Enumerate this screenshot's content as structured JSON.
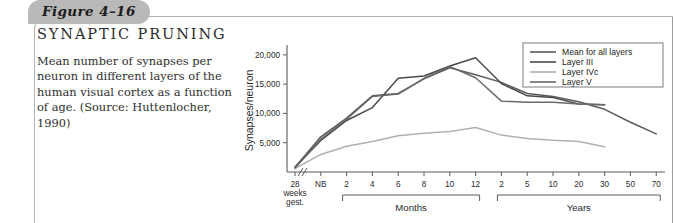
{
  "figure": {
    "tab_label": "Figure 4–16",
    "title": "SYNAPTIC PRUNING",
    "caption": "Mean number of synapses per neuron in different layers of the human visual cortex as a function of age. (Source: Huttenlocher, 1990)"
  },
  "chart_data": {
    "type": "line",
    "title": "",
    "xlabel": "",
    "ylabel": "Synapses/neuron",
    "ylim": [
      0,
      21000
    ],
    "yticks": [
      5000,
      10000,
      15000,
      20000
    ],
    "ytick_labels": [
      "5,000",
      "10,000",
      "15,000",
      "20,000"
    ],
    "grid": false,
    "legend_position": "top-right",
    "axis_break": "//",
    "x_categories": [
      "28 weeks gest.",
      "NB",
      "2",
      "4",
      "6",
      "8",
      "10",
      "12",
      "2",
      "5",
      "10",
      "20",
      "30",
      "50",
      "70"
    ],
    "x_tick_labels": [
      "28",
      "NB",
      "2",
      "4",
      "6",
      "8",
      "10",
      "12",
      "2",
      "5",
      "10",
      "20",
      "30",
      "50",
      "70"
    ],
    "x_first_label_lines": [
      "28",
      "weeks",
      "gest."
    ],
    "x_groups": [
      {
        "label": "Months",
        "from": "2",
        "to": "12"
      },
      {
        "label": "Years",
        "from": "2",
        "to": "70"
      }
    ],
    "series": [
      {
        "name": "Mean for all layers",
        "color": "#5b5b5b",
        "width": 1.5,
        "points": [
          {
            "x": "28 weeks gest.",
            "y": 800
          },
          {
            "x": "NB",
            "y": 6000
          },
          {
            "x": "2",
            "y": 9200
          },
          {
            "x": "4",
            "y": 13000
          },
          {
            "x": "6",
            "y": 13400
          },
          {
            "x": "8",
            "y": 15900
          },
          {
            "x": "10",
            "y": 17800
          },
          {
            "x": "12",
            "y": 16600
          },
          {
            "x": "2",
            "y": 15300
          },
          {
            "x": "5",
            "y": 13400
          },
          {
            "x": "10",
            "y": 12900
          },
          {
            "x": "20",
            "y": 12000
          },
          {
            "x": "30",
            "y": 10700
          },
          {
            "x": "50",
            "y": 8500
          },
          {
            "x": "70",
            "y": 6500
          }
        ]
      },
      {
        "name": "Layer III",
        "color": "#4a4a4a",
        "width": 1.5,
        "points": [
          {
            "x": "28 weeks gest.",
            "y": 800
          },
          {
            "x": "NB",
            "y": 5400
          },
          {
            "x": "2",
            "y": 8800
          },
          {
            "x": "4",
            "y": 11000
          },
          {
            "x": "6",
            "y": 16000
          },
          {
            "x": "8",
            "y": 16400
          },
          {
            "x": "10",
            "y": 18100
          },
          {
            "x": "12",
            "y": 19500
          },
          {
            "x": "2",
            "y": 15100
          },
          {
            "x": "5",
            "y": 13000
          },
          {
            "x": "10",
            "y": 12700
          },
          {
            "x": "20",
            "y": 11600
          },
          {
            "x": "30",
            "y": 11500
          }
        ]
      },
      {
        "name": "Layer IVc",
        "color": "#b0b0b0",
        "width": 1.5,
        "points": [
          {
            "x": "28 weeks gest.",
            "y": 600
          },
          {
            "x": "NB",
            "y": 3000
          },
          {
            "x": "2",
            "y": 4400
          },
          {
            "x": "4",
            "y": 5200
          },
          {
            "x": "6",
            "y": 6200
          },
          {
            "x": "8",
            "y": 6600
          },
          {
            "x": "10",
            "y": 6900
          },
          {
            "x": "12",
            "y": 7600
          },
          {
            "x": "2",
            "y": 6300
          },
          {
            "x": "5",
            "y": 5700
          },
          {
            "x": "10",
            "y": 5400
          },
          {
            "x": "20",
            "y": 5200
          },
          {
            "x": "30",
            "y": 4300
          }
        ]
      },
      {
        "name": "Layer V",
        "color": "#6a6a6a",
        "width": 1.5,
        "points": [
          {
            "x": "28 weeks gest.",
            "y": 700
          },
          {
            "x": "NB",
            "y": 5600
          },
          {
            "x": "2",
            "y": 9000
          },
          {
            "x": "4",
            "y": 12900
          },
          {
            "x": "6",
            "y": 13300
          },
          {
            "x": "8",
            "y": 16000
          },
          {
            "x": "10",
            "y": 18000
          },
          {
            "x": "12",
            "y": 16100
          },
          {
            "x": "2",
            "y": 12100
          },
          {
            "x": "5",
            "y": 11900
          },
          {
            "x": "10",
            "y": 11900
          },
          {
            "x": "20",
            "y": 11600
          },
          {
            "x": "30",
            "y": 11500
          }
        ]
      }
    ],
    "legend_entries": [
      {
        "label": "Mean for all layers",
        "color": "#5b5b5b"
      },
      {
        "label": "Layer III",
        "color": "#4a4a4a"
      },
      {
        "label": "Layer IVc",
        "color": "#b0b0b0"
      },
      {
        "label": "Layer V",
        "color": "#6a6a6a"
      }
    ]
  }
}
